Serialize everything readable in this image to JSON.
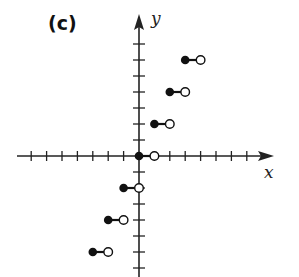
{
  "panel_label": "(c)",
  "chart_data": {
    "type": "step",
    "title": "(c)",
    "function": "y = 2*floor(x)",
    "xlabel": "x",
    "ylabel": "y",
    "xlim": [
      -8,
      8
    ],
    "ylim": [
      -7,
      7
    ],
    "tick_spacing": 1,
    "grid": false,
    "segments": [
      {
        "x_start": -3,
        "x_end": -2,
        "y": -6,
        "start": "closed",
        "end": "open"
      },
      {
        "x_start": -2,
        "x_end": -1,
        "y": -4,
        "start": "closed",
        "end": "open"
      },
      {
        "x_start": -1,
        "x_end": 0,
        "y": -2,
        "start": "closed",
        "end": "open"
      },
      {
        "x_start": 0,
        "x_end": 1,
        "y": 0,
        "start": "closed",
        "end": "open"
      },
      {
        "x_start": 1,
        "x_end": 2,
        "y": 2,
        "start": "closed",
        "end": "open"
      },
      {
        "x_start": 2,
        "x_end": 3,
        "y": 4,
        "start": "closed",
        "end": "open"
      },
      {
        "x_start": 3,
        "x_end": 4,
        "y": 6,
        "start": "closed",
        "end": "open"
      }
    ],
    "colors": {
      "axis": "#222222",
      "point": "#111111",
      "background": "#ffffff"
    }
  }
}
